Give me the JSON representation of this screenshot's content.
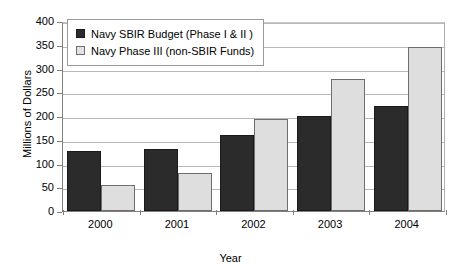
{
  "chart_data": {
    "type": "bar",
    "title": "",
    "xlabel": "Year",
    "ylabel": "Millions of Dollars",
    "categories": [
      "2000",
      "2001",
      "2002",
      "2003",
      "2004"
    ],
    "series": [
      {
        "name": "Navy SBIR Budget (Phase I & II )",
        "color": "#2b2b2b",
        "values": [
          127,
          130,
          160,
          199,
          221
        ]
      },
      {
        "name": "Navy Phase III (non-SBIR Funds)",
        "color": "#dedede",
        "values": [
          54,
          79,
          193,
          278,
          346
        ]
      }
    ],
    "ylim": [
      0,
      400
    ],
    "yticks": [
      0,
      50,
      100,
      150,
      200,
      250,
      300,
      350,
      400
    ],
    "ytick_labels": [
      "0",
      "50",
      "100",
      "150",
      "200",
      "250",
      "300",
      "350",
      "400"
    ],
    "grid": true,
    "legend_position": "top-left"
  }
}
